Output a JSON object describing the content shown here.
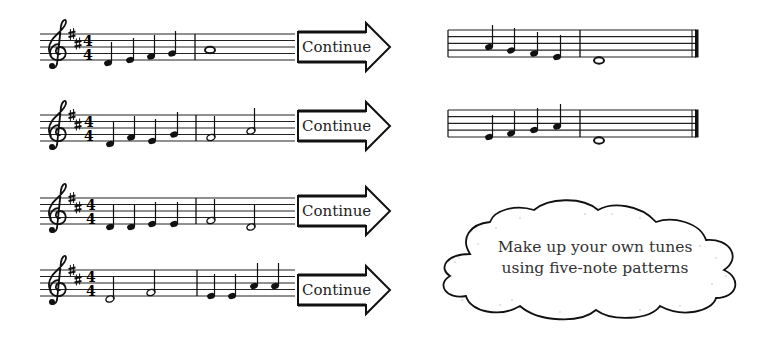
{
  "page": {
    "key_signature": "D major (F#, C#)",
    "time_signature": {
      "top": "4",
      "bottom": "4"
    }
  },
  "exercises": [
    {
      "id": 1,
      "arrow_label": "Continue",
      "measures": [
        [
          "D4 quarter",
          "E4 quarter",
          "F#4 quarter",
          "G4 quarter"
        ],
        [
          "A4 whole"
        ]
      ],
      "continuation": [
        [
          "A4 quarter",
          "G4 quarter",
          "F#4 quarter",
          "E4 quarter"
        ],
        [
          "D4 whole"
        ]
      ]
    },
    {
      "id": 2,
      "arrow_label": "Continue",
      "measures": [
        [
          "D4 quarter",
          "F#4 quarter",
          "E4 quarter",
          "G4 quarter"
        ],
        [
          "F#4 half",
          "A4 half"
        ]
      ],
      "continuation": [
        [
          "E4 quarter",
          "F#4 quarter",
          "G4 quarter",
          "A4 quarter"
        ],
        [
          "D4 whole"
        ]
      ]
    },
    {
      "id": 3,
      "arrow_label": "Continue",
      "measures": [
        [
          "D4 quarter",
          "D4 quarter",
          "E4 quarter",
          "E4 quarter"
        ],
        [
          "F#4 half",
          "D4 half"
        ]
      ]
    },
    {
      "id": 4,
      "arrow_label": "Continue",
      "measures": [
        [
          "D4 half",
          "F#4 half"
        ],
        [
          "E4 quarter",
          "E4 quarter",
          "A4 quarter",
          "A4 quarter"
        ]
      ]
    }
  ],
  "cloud": {
    "line1": "Make up your own tunes",
    "line2": "using five-note patterns"
  }
}
